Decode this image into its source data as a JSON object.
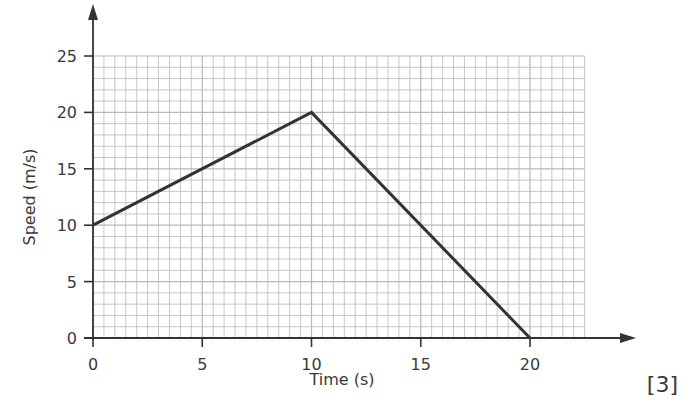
{
  "chart_data": {
    "type": "line",
    "title": "",
    "xlabel": "Time (s)",
    "ylabel": "Speed (m/s)",
    "x": [
      0,
      10,
      20
    ],
    "series": [
      {
        "name": "speed",
        "values": [
          10,
          20,
          0
        ],
        "color": "#333333"
      }
    ],
    "xlim": [
      0,
      22.5
    ],
    "ylim": [
      0,
      25
    ],
    "xticks": [
      0,
      5,
      10,
      15,
      20
    ],
    "yticks": [
      0,
      5,
      10,
      15,
      20,
      25
    ],
    "grid": true,
    "grid_minor_x_step": 0.5,
    "grid_minor_y_step": 1,
    "legend": null
  },
  "labels": {
    "xlabel": "Time (s)",
    "ylabel": "Speed (m/s)",
    "xticks": [
      "0",
      "5",
      "10",
      "15",
      "20"
    ],
    "yticks": [
      "0",
      "5",
      "10",
      "15",
      "20",
      "25"
    ],
    "marks": "[3]"
  },
  "colors": {
    "grid": "#b8b8b8",
    "axis": "#333333",
    "line": "#333333"
  }
}
